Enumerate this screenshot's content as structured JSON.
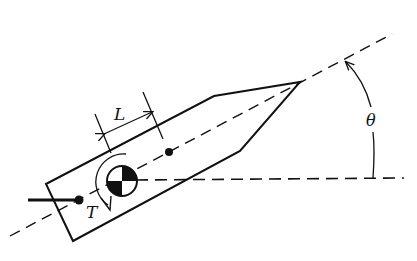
{
  "diagram": {
    "type": "rocket-thrust-vector-schematic",
    "labels": {
      "length": "L",
      "torque": "T",
      "angle": "θ"
    },
    "colors": {
      "stroke": "#111111",
      "background": "#ffffff"
    },
    "elements": [
      "body-outline",
      "centerline-axis",
      "horizontal-reference",
      "center-of-mass-symbol",
      "rear-pivot-dot",
      "forward-point-dot",
      "thrust-rod",
      "length-dimension",
      "torque-arrow",
      "angle-arc"
    ]
  }
}
